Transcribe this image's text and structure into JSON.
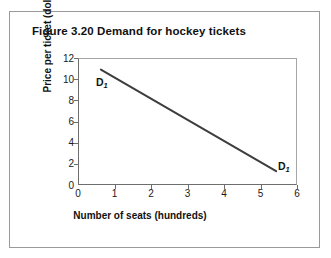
{
  "figure": {
    "title": "Figure 3.20 Demand for hockey tickets"
  },
  "chart_data": {
    "type": "line",
    "title": "Figure 3.20 Demand for hockey tickets",
    "xlabel": "Number of seats (hundreds)",
    "ylabel": "Price per ticket (dollars)",
    "xlim": [
      0,
      6
    ],
    "ylim": [
      0,
      12
    ],
    "xticks": [
      "0",
      "1",
      "2",
      "3",
      "4",
      "5",
      "6"
    ],
    "yticks": [
      "0",
      "2",
      "4",
      "6",
      "8",
      "10",
      "12"
    ],
    "grid": false,
    "legend": "none",
    "line_color": "#3d3d3d",
    "series": [
      {
        "name": "D1",
        "label_start": "D",
        "label_start_sub": "1",
        "label_end": "D",
        "label_end_sub": "1",
        "x": [
          0.6,
          5.4
        ],
        "y": [
          11.0,
          1.4
        ]
      }
    ],
    "annotations": [
      {
        "text": "D1",
        "x": 0.55,
        "y": 10.2
      },
      {
        "text": "D1",
        "x": 5.55,
        "y": 2.4
      }
    ]
  }
}
